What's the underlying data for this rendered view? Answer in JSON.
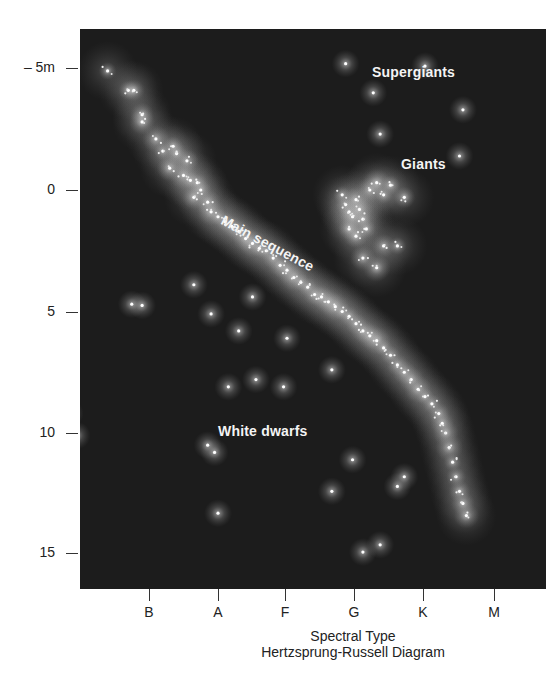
{
  "chart_data": {
    "type": "scatter",
    "title": "Hertzsprung-Russell Diagram",
    "xlabel": "Spectral Type",
    "ylabel": "Absolute magnitude",
    "x_categories": [
      "B",
      "A",
      "F",
      "G",
      "K",
      "M"
    ],
    "y_ticks": [
      "– 5m",
      "0",
      "5",
      "10",
      "15"
    ],
    "y_tick_values": [
      -5,
      0,
      5,
      10,
      15
    ],
    "ylim": [
      -6.4,
      16.6
    ],
    "y_inverted": true,
    "grid": false,
    "legend": "none",
    "background": "#1c1c1c",
    "star_color": "#ffffff",
    "annotations": [
      {
        "text": "Supergiants",
        "x": 4.25,
        "y": -5.2
      },
      {
        "text": "Giants",
        "x": 4.0,
        "y": -1.0
      },
      {
        "text": "Main sequence",
        "x": 3.3,
        "y": 1.5,
        "rotation": 28
      },
      {
        "text": "White dwarfs",
        "x": 2.5,
        "y": 9.9
      }
    ],
    "series": [
      {
        "name": "Main sequence",
        "points": [
          [
            0.4,
            -4.9
          ],
          [
            0.7,
            -4.1
          ],
          [
            0.78,
            -4.1
          ],
          [
            0.9,
            -3.1
          ],
          [
            0.9,
            -2.8
          ],
          [
            1.1,
            -2.1
          ],
          [
            1.2,
            -1.6
          ],
          [
            1.35,
            -1.8
          ],
          [
            1.4,
            -1.5
          ],
          [
            1.55,
            -1.2
          ],
          [
            1.3,
            -0.9
          ],
          [
            1.5,
            -0.6
          ],
          [
            1.6,
            -0.4
          ],
          [
            1.7,
            -0.3
          ],
          [
            1.75,
            0.0
          ],
          [
            1.65,
            0.3
          ],
          [
            1.85,
            0.5
          ],
          [
            1.9,
            0.9
          ],
          [
            2.0,
            1.1
          ],
          [
            2.1,
            1.3
          ],
          [
            2.2,
            1.5
          ],
          [
            2.3,
            1.7
          ],
          [
            2.4,
            2.0
          ],
          [
            2.5,
            2.2
          ],
          [
            2.6,
            2.4
          ],
          [
            2.7,
            2.5
          ],
          [
            2.8,
            2.8
          ],
          [
            2.9,
            3.1
          ],
          [
            3.0,
            3.3
          ],
          [
            3.1,
            3.6
          ],
          [
            3.2,
            3.8
          ],
          [
            3.3,
            4.0
          ],
          [
            3.4,
            4.3
          ],
          [
            3.5,
            4.4
          ],
          [
            3.6,
            4.6
          ],
          [
            3.7,
            4.8
          ],
          [
            3.8,
            5.0
          ],
          [
            3.9,
            5.2
          ],
          [
            4.0,
            5.5
          ],
          [
            4.1,
            5.8
          ],
          [
            4.2,
            6.0
          ],
          [
            4.3,
            6.2
          ],
          [
            4.4,
            6.5
          ],
          [
            4.5,
            6.8
          ],
          [
            4.6,
            7.2
          ],
          [
            4.7,
            7.5
          ],
          [
            4.8,
            7.8
          ],
          [
            4.9,
            8.2
          ],
          [
            5.0,
            8.5
          ],
          [
            5.1,
            8.8
          ],
          [
            5.2,
            9.2
          ],
          [
            5.25,
            9.6
          ],
          [
            5.3,
            10.0
          ],
          [
            5.35,
            10.6
          ],
          [
            5.4,
            11.2
          ],
          [
            5.45,
            11.8
          ],
          [
            5.5,
            12.4
          ],
          [
            5.55,
            12.9
          ],
          [
            5.6,
            13.4
          ]
        ]
      },
      {
        "name": "Giants",
        "points": [
          [
            3.8,
            0.2
          ],
          [
            3.85,
            0.6
          ],
          [
            3.9,
            0.9
          ],
          [
            3.95,
            1.1
          ],
          [
            4.0,
            0.4
          ],
          [
            4.05,
            0.8
          ],
          [
            4.1,
            1.2
          ],
          [
            4.15,
            1.6
          ],
          [
            3.9,
            1.6
          ],
          [
            4.0,
            1.9
          ],
          [
            4.2,
            0.0
          ],
          [
            4.3,
            -0.3
          ],
          [
            4.4,
            0.2
          ],
          [
            4.5,
            -0.2
          ],
          [
            4.7,
            0.3
          ],
          [
            4.4,
            2.3
          ],
          [
            4.1,
            2.8
          ],
          [
            4.3,
            3.2
          ],
          [
            4.6,
            2.3
          ]
        ]
      },
      {
        "name": "Supergiants",
        "points": [
          [
            3.85,
            -5.2
          ],
          [
            4.35,
            -2.3
          ],
          [
            4.25,
            -4.0
          ],
          [
            5.0,
            -5.1
          ],
          [
            5.55,
            -3.3
          ],
          [
            5.5,
            -1.4
          ]
        ]
      },
      {
        "name": "White dwarfs / scattered",
        "points": [
          [
            0.75,
            4.7
          ],
          [
            0.9,
            4.75
          ],
          [
            1.65,
            3.9
          ],
          [
            1.9,
            5.1
          ],
          [
            2.5,
            4.4
          ],
          [
            2.3,
            5.8
          ],
          [
            2.15,
            8.1
          ],
          [
            1.85,
            10.5
          ],
          [
            1.95,
            10.8
          ],
          [
            -0.15,
            9.2
          ],
          [
            -0.05,
            10.1
          ],
          [
            2.0,
            13.3
          ],
          [
            3.65,
            12.4
          ],
          [
            4.1,
            14.9
          ],
          [
            4.35,
            14.6
          ],
          [
            4.6,
            12.2
          ],
          [
            4.7,
            11.8
          ],
          [
            3.95,
            11.1
          ],
          [
            3.0,
            6.1
          ],
          [
            2.95,
            8.1
          ],
          [
            2.55,
            7.8
          ],
          [
            3.65,
            7.4
          ]
        ]
      }
    ]
  }
}
